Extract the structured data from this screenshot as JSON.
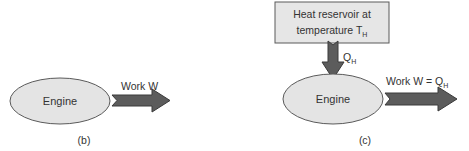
{
  "panels": [
    {
      "id": "b",
      "caption": "(b)",
      "engine_label": "Engine",
      "work_label": "Work W",
      "work_sub": ""
    },
    {
      "id": "c",
      "caption": "(c)",
      "engine_label": "Engine",
      "reservoir_line1": "Heat reservoir at",
      "reservoir_line2": "temperature T",
      "reservoir_sub": "H",
      "heat_label": "Q",
      "heat_sub": "H",
      "work_label": "Work W = Q",
      "work_sub": "H"
    }
  ],
  "colors": {
    "engine_fill": "#e4e4e4",
    "box_fill": "#e6e6e6",
    "outline": "#5a5a5a",
    "arrow_fill": "#5c5c5c",
    "arrow_stroke": "#3a3a3a",
    "text": "#333333"
  }
}
